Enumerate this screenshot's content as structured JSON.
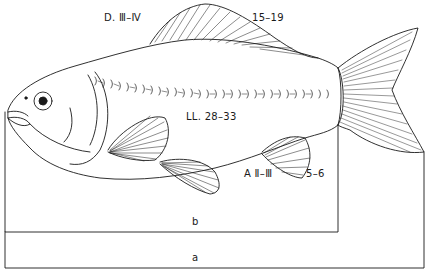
{
  "figure": {
    "line_color": "#1a1a1a",
    "background": "#ffffff"
  },
  "labels": {
    "dorsal_fin_rays": "D. Ⅲ–Ⅳ",
    "dorsal_fin_count": "15–19",
    "lateral_line": "LL. 28–33",
    "anal_fin_rays": "A Ⅱ–Ⅲ",
    "anal_fin_count": "5–6",
    "standard_length": "b",
    "total_length": "a"
  },
  "measurements": [
    {
      "key": "b",
      "meaning": "standard length bracket",
      "x_start": 5,
      "x_end": 338,
      "y": 232
    },
    {
      "key": "a",
      "meaning": "total length bracket",
      "x_start": 5,
      "x_end": 424,
      "y": 268
    }
  ]
}
